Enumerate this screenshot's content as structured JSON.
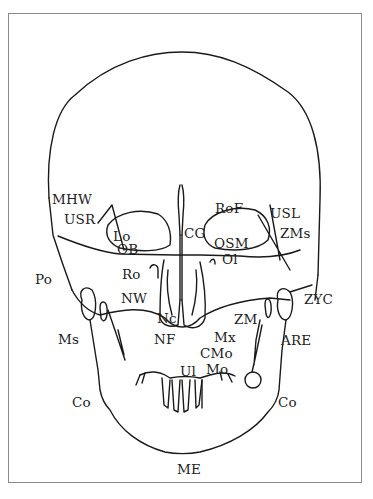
{
  "diagram": {
    "type": "anatomical line drawing",
    "line_color": "#1a1a1a",
    "background": "#ffffff"
  },
  "labels": {
    "MHW": "MHW",
    "USR": "USR",
    "Lo": "Lo",
    "OB": "OB",
    "Po": "Po",
    "Ro": "Ro",
    "NW": "NW",
    "Nc": "Nc",
    "NF": "NF",
    "Ms": "Ms",
    "Co_left": "Co",
    "CG": "CG",
    "RoF": "RoF",
    "USL": "USL",
    "ZMs": "ZMs",
    "OSM": "OSM",
    "Ol": "Ol",
    "ZYC": "ZYC",
    "ZM": "ZM",
    "Mx": "Mx",
    "ARE": "ARE",
    "CMo": "CMo",
    "Mo": "Mo",
    "Ul": "Ul",
    "Co_right": "Co",
    "ME": "ME"
  }
}
